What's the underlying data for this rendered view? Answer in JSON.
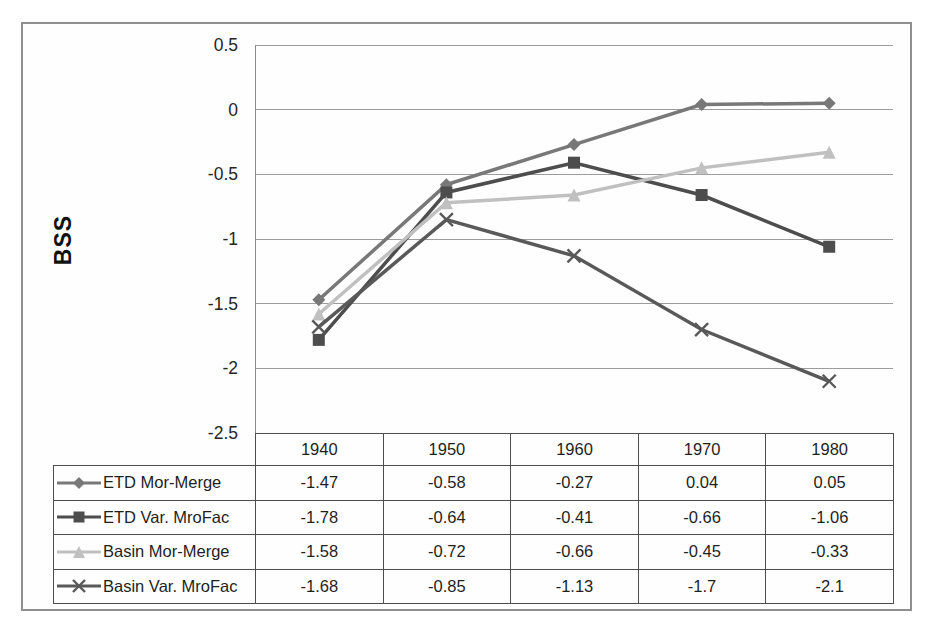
{
  "chart_data": {
    "type": "line",
    "title": "",
    "xlabel": "",
    "ylabel": "BSS",
    "categories": [
      "1940",
      "1950",
      "1960",
      "1970",
      "1980"
    ],
    "series": [
      {
        "name": "ETD Mor-Merge",
        "marker": "diamond",
        "color": "#787878",
        "values": [
          -1.47,
          -0.58,
          -0.27,
          0.04,
          0.05
        ]
      },
      {
        "name": "ETD Var. MroFac",
        "marker": "square",
        "color": "#4d4d4d",
        "values": [
          -1.78,
          -0.64,
          -0.41,
          -0.66,
          -1.06
        ]
      },
      {
        "name": "Basin Mor-Merge",
        "marker": "triangle",
        "color": "#c0c0c0",
        "values": [
          -1.58,
          -0.72,
          -0.66,
          -0.45,
          -0.33
        ]
      },
      {
        "name": "Basin Var. MroFac",
        "marker": "x",
        "color": "#595959",
        "values": [
          -1.68,
          -0.85,
          -1.13,
          -1.7,
          -2.1
        ]
      }
    ],
    "ylim": [
      -2.5,
      0.5
    ],
    "ytick_step": 0.5,
    "yticks": [
      "0.5",
      "0",
      "-0.5",
      "-1",
      "-1.5",
      "-2",
      "-2.5"
    ],
    "grid": true,
    "gridline_color": "#9c9c9c",
    "axis_line_color": "#8a8a8a",
    "legend_position": "table-left"
  },
  "table": {
    "columns": [
      "1940",
      "1950",
      "1960",
      "1970",
      "1980"
    ],
    "rows": [
      {
        "label": "ETD Mor-Merge",
        "values": [
          "-1.47",
          "-0.58",
          "-0.27",
          "0.04",
          "0.05"
        ]
      },
      {
        "label": "ETD Var. MroFac",
        "values": [
          "-1.78",
          "-0.64",
          "-0.41",
          "-0.66",
          "-1.06"
        ]
      },
      {
        "label": "Basin Mor-Merge",
        "values": [
          "-1.58",
          "-0.72",
          "-0.66",
          "-0.45",
          "-0.33"
        ]
      },
      {
        "label": "Basin Var. MroFac",
        "values": [
          "-1.68",
          "-0.85",
          "-1.13",
          "-1.7",
          "-2.1"
        ]
      }
    ],
    "border_color": "#4d4d4d"
  }
}
